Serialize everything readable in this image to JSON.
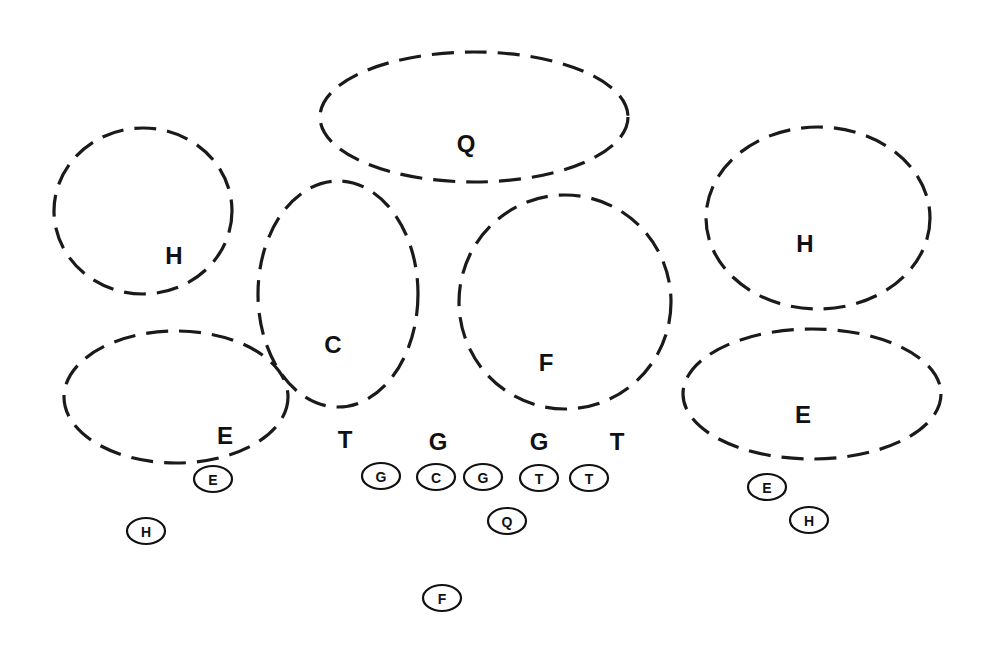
{
  "diagram": {
    "zones": [
      {
        "id": "zone-q",
        "label": "Q",
        "cx": 474,
        "cy": 117,
        "rx": 154,
        "ry": 65,
        "lx": 466,
        "ly": 143
      },
      {
        "id": "zone-h-left",
        "label": "H",
        "cx": 143,
        "cy": 211,
        "rx": 89,
        "ry": 83,
        "lx": 174,
        "ly": 255
      },
      {
        "id": "zone-c",
        "label": "C",
        "cx": 338,
        "cy": 294,
        "rx": 80,
        "ry": 113,
        "lx": 333,
        "ly": 344
      },
      {
        "id": "zone-f",
        "label": "F",
        "cx": 565,
        "cy": 302,
        "rx": 106,
        "ry": 107,
        "lx": 546,
        "ly": 362
      },
      {
        "id": "zone-h-right",
        "label": "H",
        "cx": 818,
        "cy": 218,
        "rx": 112,
        "ry": 91,
        "lx": 805,
        "ly": 243
      },
      {
        "id": "zone-e-left",
        "label": "E",
        "cx": 176,
        "cy": 397,
        "rx": 112,
        "ry": 66,
        "lx": 225,
        "ly": 435
      },
      {
        "id": "zone-e-right",
        "label": "E",
        "cx": 812,
        "cy": 394,
        "rx": 129,
        "ry": 65,
        "lx": 803,
        "ly": 414
      }
    ],
    "defenders": [
      {
        "id": "def-t-left",
        "label": "T",
        "x": 345,
        "y": 439
      },
      {
        "id": "def-g-left",
        "label": "G",
        "x": 438,
        "y": 441
      },
      {
        "id": "def-g-right",
        "label": "G",
        "x": 539,
        "y": 441
      },
      {
        "id": "def-t-right",
        "label": "T",
        "x": 617,
        "y": 441
      }
    ],
    "offense": [
      {
        "id": "off-e-left",
        "label": "E",
        "x": 213,
        "y": 479
      },
      {
        "id": "off-h-left",
        "label": "H",
        "x": 146,
        "y": 531
      },
      {
        "id": "off-g-left",
        "label": "G",
        "x": 381,
        "y": 476
      },
      {
        "id": "off-c",
        "label": "C",
        "x": 436,
        "y": 477
      },
      {
        "id": "off-g-right",
        "label": "G",
        "x": 483,
        "y": 477
      },
      {
        "id": "off-t-left",
        "label": "T",
        "x": 539,
        "y": 478
      },
      {
        "id": "off-t-right",
        "label": "T",
        "x": 589,
        "y": 478
      },
      {
        "id": "off-q",
        "label": "Q",
        "x": 507,
        "y": 521
      },
      {
        "id": "off-f",
        "label": "F",
        "x": 442,
        "y": 598
      },
      {
        "id": "off-e-right",
        "label": "E",
        "x": 767,
        "y": 487
      },
      {
        "id": "off-h-right",
        "label": "H",
        "x": 809,
        "y": 520
      }
    ],
    "player_rx": 19,
    "player_ry": 13
  }
}
